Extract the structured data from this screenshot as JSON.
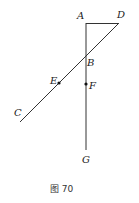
{
  "figure": {
    "caption": "图 70",
    "points": {
      "A": "A",
      "B": "B",
      "C": "C",
      "D": "D",
      "E": "E",
      "F": "F",
      "G": "G"
    },
    "segments": [
      "AD",
      "AG",
      "DC"
    ],
    "marked_points": [
      "E",
      "F"
    ]
  }
}
